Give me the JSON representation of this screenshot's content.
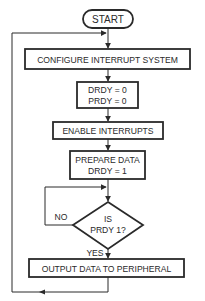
{
  "diagram": {
    "type": "flowchart",
    "colors": {
      "stroke": "#2a2a2a",
      "background": "#ffffff",
      "text": "#2a2a2a"
    },
    "nodes": {
      "start": {
        "shape": "terminator",
        "lines": [
          "START"
        ]
      },
      "configure": {
        "shape": "process",
        "lines": [
          "CONFIGURE INTERRUPT SYSTEM"
        ]
      },
      "init_flags": {
        "shape": "process",
        "lines": [
          "DRDY = 0",
          "PRDY = 0"
        ]
      },
      "enable": {
        "shape": "process",
        "lines": [
          "ENABLE INTERRUPTS"
        ]
      },
      "prepare": {
        "shape": "process",
        "lines": [
          "PREPARE DATA",
          "DRDY = 1"
        ]
      },
      "decision": {
        "shape": "decision",
        "lines": [
          "IS",
          "PRDY 1?"
        ]
      },
      "output": {
        "shape": "process",
        "lines": [
          "OUTPUT DATA TO PERIPHERAL"
        ]
      }
    },
    "edge_labels": {
      "no": "NO",
      "yes": "YES"
    },
    "edges": [
      {
        "from": "start",
        "to": "configure"
      },
      {
        "from": "configure",
        "to": "init_flags"
      },
      {
        "from": "init_flags",
        "to": "enable"
      },
      {
        "from": "enable",
        "to": "prepare"
      },
      {
        "from": "prepare",
        "to": "decision"
      },
      {
        "from": "decision",
        "to": "decision",
        "label": "NO",
        "note": "loop back to decision input"
      },
      {
        "from": "decision",
        "to": "output",
        "label": "YES"
      },
      {
        "from": "output",
        "to": "configure",
        "note": "loop back via left side"
      }
    ]
  }
}
